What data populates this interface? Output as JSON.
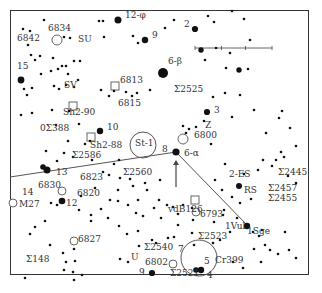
{
  "chart": {
    "type": "star-finder-chart",
    "scale_bar": {
      "x1": 195,
      "x2": 272,
      "y": 48
    }
  },
  "labels": [
    {
      "id": "12-phi",
      "text": "12-φ",
      "x": 125,
      "y": 16
    },
    {
      "id": "9-top",
      "text": "9",
      "x": 152,
      "y": 36
    },
    {
      "id": "6834",
      "text": "6834",
      "x": 48,
      "y": 29
    },
    {
      "id": "6842",
      "text": "6842",
      "x": 17,
      "y": 39
    },
    {
      "id": "SU",
      "text": "SU",
      "x": 78,
      "y": 40
    },
    {
      "id": "2",
      "text": "2",
      "x": 184,
      "y": 25
    },
    {
      "id": "6-beta",
      "text": "6-β",
      "x": 168,
      "y": 62
    },
    {
      "id": "15",
      "text": "15",
      "x": 17,
      "y": 67
    },
    {
      "id": "SV",
      "text": "SV",
      "x": 64,
      "y": 86
    },
    {
      "id": "6813",
      "text": "6813",
      "x": 120,
      "y": 81
    },
    {
      "id": "S2525",
      "text": "Σ2525",
      "x": 174,
      "y": 90
    },
    {
      "id": "6815",
      "text": "6815",
      "x": 118,
      "y": 104
    },
    {
      "id": "Sh2-90",
      "text": "Sh2-90",
      "x": 63,
      "y": 113
    },
    {
      "id": "3",
      "text": "3",
      "x": 214,
      "y": 111
    },
    {
      "id": "OS388",
      "text": "0Σ388",
      "x": 40,
      "y": 129
    },
    {
      "id": "10",
      "text": "10",
      "x": 107,
      "y": 128
    },
    {
      "id": "Z",
      "text": "Z",
      "x": 205,
      "y": 126
    },
    {
      "id": "St-1",
      "text": "St-1",
      "x": 135,
      "y": 144
    },
    {
      "id": "6800",
      "text": "6800",
      "x": 194,
      "y": 136
    },
    {
      "id": "Sh2-88",
      "text": "Sh2-88",
      "x": 90,
      "y": 146
    },
    {
      "id": "8",
      "text": "8",
      "x": 162,
      "y": 150
    },
    {
      "id": "6-alpha",
      "text": "6-α",
      "x": 184,
      "y": 154
    },
    {
      "id": "S2586",
      "text": "Σ2586",
      "x": 72,
      "y": 156
    },
    {
      "id": "13",
      "text": "13",
      "x": 56,
      "y": 173
    },
    {
      "id": "S2560",
      "text": "Σ2560",
      "x": 123,
      "y": 173
    },
    {
      "id": "2-ES",
      "text": "2-ES",
      "x": 229,
      "y": 175
    },
    {
      "id": "S2445",
      "text": "Σ2445",
      "x": 278,
      "y": 173
    },
    {
      "id": "6823",
      "text": "6823",
      "x": 80,
      "y": 178
    },
    {
      "id": "6830",
      "text": "6830",
      "x": 38,
      "y": 186
    },
    {
      "id": "14",
      "text": "14",
      "x": 22,
      "y": 193
    },
    {
      "id": "RS",
      "text": "RS",
      "x": 244,
      "y": 191
    },
    {
      "id": "S2457",
      "text": "Σ2457",
      "x": 268,
      "y": 189
    },
    {
      "id": "6820",
      "text": "6820",
      "x": 77,
      "y": 194
    },
    {
      "id": "S2455",
      "text": "Σ2455",
      "x": 268,
      "y": 199
    },
    {
      "id": "M27",
      "text": "M27",
      "x": 19,
      "y": 205
    },
    {
      "id": "12-low",
      "text": "12",
      "x": 66,
      "y": 204
    },
    {
      "id": "vdB126",
      "text": "vdB126",
      "x": 168,
      "y": 210
    },
    {
      "id": "6793",
      "text": "6793",
      "x": 200,
      "y": 215
    },
    {
      "id": "1Vul",
      "text": "1Vul",
      "x": 225,
      "y": 227
    },
    {
      "id": "1Sge",
      "text": "1Sge",
      "x": 247,
      "y": 232
    },
    {
      "id": "6827",
      "text": "6827",
      "x": 78,
      "y": 240
    },
    {
      "id": "S2523",
      "text": "Σ2523",
      "x": 198,
      "y": 237
    },
    {
      "id": "S148",
      "text": "Σ148",
      "x": 26,
      "y": 260
    },
    {
      "id": "S2540",
      "text": "Σ2540",
      "x": 144,
      "y": 248
    },
    {
      "id": "U",
      "text": "U",
      "x": 131,
      "y": 258
    },
    {
      "id": "7",
      "text": "7",
      "x": 178,
      "y": 250
    },
    {
      "id": "Cr399",
      "text": "Cr399",
      "x": 215,
      "y": 261
    },
    {
      "id": "6802",
      "text": "6802",
      "x": 145,
      "y": 263
    },
    {
      "id": "5",
      "text": "5",
      "x": 204,
      "y": 262
    },
    {
      "id": "9-low",
      "text": "9",
      "x": 139,
      "y": 273
    },
    {
      "id": "S2521",
      "text": "Σ2521",
      "x": 170,
      "y": 274
    },
    {
      "id": "4",
      "text": "4",
      "x": 207,
      "y": 276
    }
  ],
  "bright_stars": [
    {
      "x": 118,
      "y": 20,
      "r": 3.5
    },
    {
      "x": 145,
      "y": 40,
      "r": 3.2
    },
    {
      "x": 195,
      "y": 29,
      "r": 3.1
    },
    {
      "x": 163,
      "y": 73,
      "r": 5
    },
    {
      "x": 21,
      "y": 80,
      "r": 3.4
    },
    {
      "x": 100,
      "y": 131,
      "r": 3.2
    },
    {
      "x": 47,
      "y": 170,
      "r": 3.5
    },
    {
      "x": 43,
      "y": 167,
      "r": 2.8
    },
    {
      "x": 62,
      "y": 201,
      "r": 3.3
    },
    {
      "x": 176,
      "y": 152,
      "r": 3.6
    },
    {
      "x": 207,
      "y": 112,
      "r": 3.1
    },
    {
      "x": 239,
      "y": 186,
      "r": 3
    },
    {
      "x": 247,
      "y": 226,
      "r": 3.2
    },
    {
      "x": 152,
      "y": 273,
      "r": 3.1
    },
    {
      "x": 201,
      "y": 270,
      "r": 3.2
    },
    {
      "x": 196,
      "y": 270,
      "r": 2.8
    },
    {
      "x": 201,
      "y": 50,
      "r": 2.7
    },
    {
      "x": 239,
      "y": 70,
      "r": 2.7
    }
  ],
  "small_stars": [
    [
      44,
      20
    ],
    [
      23,
      29
    ],
    [
      30,
      31
    ],
    [
      64,
      37
    ],
    [
      70,
      38
    ],
    [
      104,
      37
    ],
    [
      103,
      21
    ],
    [
      99,
      21
    ],
    [
      133,
      36
    ],
    [
      138,
      43
    ],
    [
      28,
      45
    ],
    [
      31,
      55
    ],
    [
      40,
      56
    ],
    [
      35,
      60
    ],
    [
      53,
      58
    ],
    [
      66,
      66
    ],
    [
      74,
      61
    ],
    [
      80,
      61
    ],
    [
      62,
      66
    ],
    [
      58,
      69
    ],
    [
      68,
      74
    ],
    [
      51,
      71
    ],
    [
      41,
      74
    ],
    [
      24,
      89
    ],
    [
      32,
      88
    ],
    [
      27,
      95
    ],
    [
      54,
      86
    ],
    [
      59,
      89
    ],
    [
      66,
      85
    ],
    [
      74,
      87
    ],
    [
      78,
      80
    ],
    [
      101,
      90
    ],
    [
      109,
      96
    ],
    [
      114,
      91
    ],
    [
      126,
      92
    ],
    [
      132,
      96
    ],
    [
      137,
      93
    ],
    [
      150,
      90
    ],
    [
      165,
      28
    ],
    [
      174,
      20
    ],
    [
      208,
      16
    ],
    [
      214,
      22
    ],
    [
      232,
      11
    ],
    [
      244,
      19
    ],
    [
      250,
      40
    ],
    [
      230,
      53
    ],
    [
      205,
      60
    ],
    [
      216,
      48
    ],
    [
      248,
      69
    ],
    [
      226,
      68
    ],
    [
      213,
      97
    ],
    [
      225,
      93
    ],
    [
      240,
      95
    ],
    [
      232,
      117
    ],
    [
      254,
      110
    ],
    [
      282,
      111
    ],
    [
      279,
      118
    ],
    [
      266,
      133
    ],
    [
      290,
      128
    ],
    [
      296,
      146
    ],
    [
      281,
      152
    ],
    [
      284,
      157
    ],
    [
      276,
      160
    ],
    [
      272,
      166
    ],
    [
      263,
      160
    ],
    [
      258,
      170
    ],
    [
      244,
      174
    ],
    [
      225,
      164
    ],
    [
      211,
      144
    ],
    [
      204,
      121
    ],
    [
      196,
      127
    ],
    [
      189,
      129
    ],
    [
      183,
      126
    ],
    [
      186,
      133
    ],
    [
      215,
      180
    ],
    [
      222,
      190
    ],
    [
      232,
      197
    ],
    [
      288,
      176
    ],
    [
      296,
      183
    ],
    [
      21,
      115
    ],
    [
      32,
      113
    ],
    [
      52,
      110
    ],
    [
      69,
      111
    ],
    [
      56,
      125
    ],
    [
      79,
      124
    ],
    [
      68,
      141
    ],
    [
      85,
      144
    ],
    [
      90,
      141
    ],
    [
      46,
      151
    ],
    [
      57,
      161
    ],
    [
      64,
      153
    ],
    [
      73,
      157
    ],
    [
      92,
      160
    ],
    [
      114,
      164
    ],
    [
      119,
      160
    ],
    [
      103,
      172
    ],
    [
      109,
      175
    ],
    [
      120,
      178
    ],
    [
      130,
      179
    ],
    [
      133,
      186
    ],
    [
      118,
      190
    ],
    [
      95,
      188
    ],
    [
      81,
      196
    ],
    [
      51,
      203
    ],
    [
      57,
      205
    ],
    [
      79,
      210
    ],
    [
      91,
      215
    ],
    [
      101,
      209
    ],
    [
      110,
      200
    ],
    [
      118,
      201
    ],
    [
      128,
      205
    ],
    [
      136,
      213
    ],
    [
      143,
      216
    ],
    [
      35,
      227
    ],
    [
      45,
      221
    ],
    [
      91,
      221
    ],
    [
      108,
      218
    ],
    [
      119,
      226
    ],
    [
      127,
      234
    ],
    [
      138,
      231
    ],
    [
      30,
      234
    ],
    [
      50,
      245
    ],
    [
      63,
      253
    ],
    [
      74,
      249
    ],
    [
      75,
      261
    ],
    [
      66,
      262
    ],
    [
      64,
      270
    ],
    [
      73,
      272
    ],
    [
      74,
      280
    ],
    [
      82,
      275
    ],
    [
      25,
      278
    ],
    [
      120,
      259
    ],
    [
      128,
      262
    ],
    [
      139,
      246
    ],
    [
      152,
      240
    ],
    [
      156,
      243
    ],
    [
      168,
      238
    ],
    [
      174,
      237
    ],
    [
      192,
      233
    ],
    [
      194,
      245
    ],
    [
      213,
      243
    ],
    [
      220,
      240
    ],
    [
      230,
      232
    ],
    [
      253,
      232
    ],
    [
      259,
      236
    ],
    [
      262,
      230
    ],
    [
      265,
      245
    ],
    [
      270,
      250
    ],
    [
      278,
      254
    ],
    [
      289,
      250
    ],
    [
      296,
      258
    ],
    [
      285,
      232
    ],
    [
      233,
      262
    ],
    [
      243,
      268
    ],
    [
      254,
      249
    ],
    [
      261,
      262
    ],
    [
      167,
      205
    ],
    [
      173,
      207
    ],
    [
      178,
      214
    ],
    [
      183,
      205
    ],
    [
      161,
      218
    ],
    [
      154,
      208
    ],
    [
      138,
      200
    ],
    [
      145,
      183
    ],
    [
      147,
      190
    ],
    [
      160,
      180
    ],
    [
      159,
      200
    ],
    [
      240,
      203
    ],
    [
      251,
      199
    ],
    [
      224,
      210
    ],
    [
      223,
      215
    ],
    [
      237,
      218
    ],
    [
      214,
      222
    ],
    [
      192,
      208
    ],
    [
      193,
      220
    ],
    [
      178,
      225
    ]
  ],
  "open_circles": [
    {
      "x": 57,
      "y": 40,
      "r": 5,
      "label": "6834"
    },
    {
      "x": 183,
      "y": 139,
      "r": 5,
      "label": "6800"
    },
    {
      "x": 62,
      "y": 191,
      "r": 4,
      "label": "6830"
    },
    {
      "x": 74,
      "y": 241,
      "r": 4,
      "label": "6827"
    },
    {
      "x": 196,
      "y": 212,
      "r": 4,
      "label": "6793"
    },
    {
      "x": 173,
      "y": 264,
      "r": 4,
      "label": "6802"
    },
    {
      "x": 13,
      "y": 203,
      "r": 4,
      "label": "M27"
    }
  ],
  "large_circles": [
    {
      "x": 143,
      "y": 145,
      "r": 13,
      "label": "St-1"
    },
    {
      "x": 199,
      "y": 258,
      "r": 18,
      "label": "Cr399"
    }
  ],
  "squares": [
    {
      "x": 115,
      "y": 86,
      "label": "6813"
    },
    {
      "x": 73,
      "y": 106,
      "label": "Sh2-90"
    },
    {
      "x": 91,
      "y": 137,
      "label": "Sh2-88"
    },
    {
      "x": 195,
      "y": 200,
      "label": "vdB126"
    }
  ],
  "lines": [
    {
      "x1": 10,
      "y1": 177,
      "x2": 176,
      "y2": 152
    },
    {
      "x1": 176,
      "y1": 152,
      "x2": 248,
      "y2": 226
    }
  ],
  "arrow": {
    "x": 176,
    "y1": 187,
    "y2": 160
  }
}
